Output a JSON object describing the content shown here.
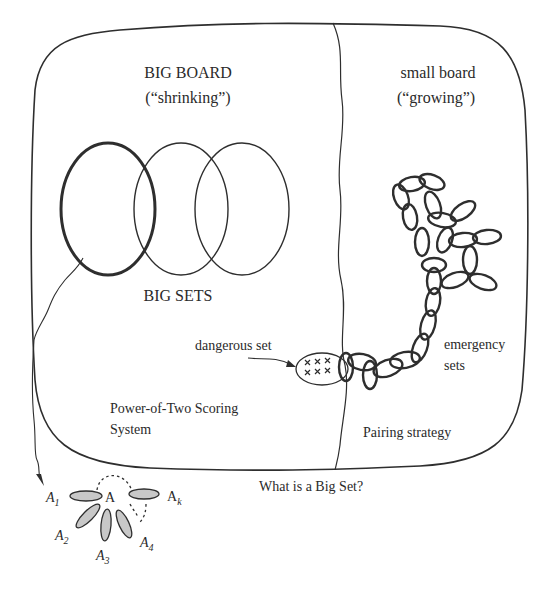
{
  "big_board": {
    "title": "BIG BOARD",
    "subtitle": "(“shrinking”)",
    "sets_label": "BIG SETS",
    "scoring_line1": "Power-of-Two Scoring",
    "scoring_line2": "System"
  },
  "small_board": {
    "title": "small board",
    "subtitle": "(“growing”)",
    "emergency_line1": "emergency",
    "emergency_line2": "sets",
    "strategy": "Pairing strategy"
  },
  "dangerous": {
    "label": "dangerous set",
    "marks": "× × ×"
  },
  "big_set_detail": {
    "question": "What is a Big Set?",
    "center": "A",
    "a1": "A",
    "a1_sub": "1",
    "a2": "A",
    "a2_sub": "2",
    "a3": "A",
    "a3_sub": "3",
    "a4": "A",
    "a4_sub": "4",
    "ak": "A",
    "ak_sub": "k"
  },
  "colors": {
    "line": "#2e2e2e",
    "petal_fill": "#c8c8c8",
    "background": "#ffffff"
  }
}
